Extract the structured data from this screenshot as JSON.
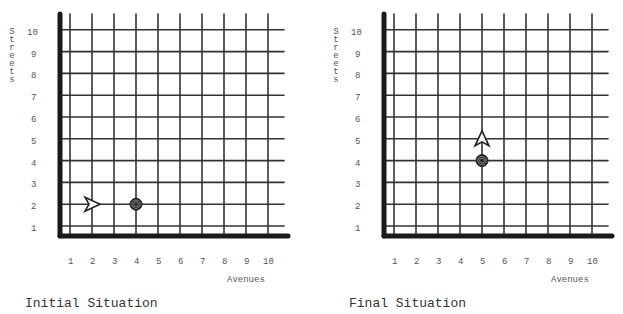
{
  "panels": [
    {
      "caption": "Initial Situation",
      "y_axis_label": "Streets",
      "x_axis_label": "Avenues",
      "robot": {
        "avenue": 2,
        "street": 2,
        "facing": "east"
      },
      "beeper": {
        "avenue": 4,
        "street": 2
      }
    },
    {
      "caption": "Final Situation",
      "y_axis_label": "Streets",
      "x_axis_label": "Avenues",
      "robot": {
        "avenue": 5,
        "street": 5,
        "facing": "north"
      },
      "beeper": {
        "avenue": 5,
        "street": 4
      }
    }
  ],
  "avenue_labels": [
    "1",
    "2",
    "3",
    "4",
    "5",
    "6",
    "7",
    "8",
    "9",
    "10"
  ],
  "street_labels": [
    "1",
    "2",
    "3",
    "4",
    "5",
    "6",
    "7",
    "8",
    "9",
    "10"
  ],
  "colors": {
    "grid": "#333333",
    "axis": "#1a1a1a",
    "text": "#555555"
  }
}
